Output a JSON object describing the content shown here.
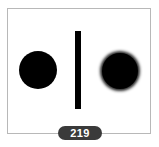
{
  "figure": {
    "left_shape": "sharp-edged black circle",
    "divider": "vertical black bar",
    "right_shape": "blurred-edge black circle"
  },
  "badge": {
    "label": "219"
  }
}
